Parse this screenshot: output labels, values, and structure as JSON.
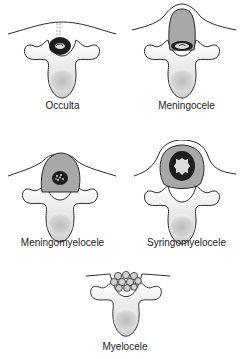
{
  "diagram": {
    "colors": {
      "outline": "#2a2a2a",
      "vertebra_light": "#f2f2f2",
      "vertebra_shade": "#c8c8c8",
      "sac_gray": "#a8a8a8",
      "cord_dark": "#1e1e1e",
      "cord_light": "#dcdcdc"
    },
    "panels": [
      {
        "id": "occulta",
        "label": "Occulta"
      },
      {
        "id": "meningocele",
        "label": "Meningocele"
      },
      {
        "id": "meningomyelocele",
        "label": "Meningomyelocele"
      },
      {
        "id": "syringomyelocele",
        "label": "Syringomyelocele"
      },
      {
        "id": "myelocele",
        "label": "Myelocele"
      }
    ]
  }
}
